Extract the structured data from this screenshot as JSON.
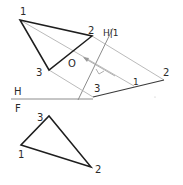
{
  "colors": {
    "background": "#ffffff",
    "object_line": "#1e1e1e",
    "construction_line": "#a8a8a8",
    "folding_line": "#8c8c8c",
    "label": "#2a2a2a"
  },
  "views": {
    "horizontal": {
      "name": "Top view (H)",
      "vertices": {
        "1": {
          "label": "1",
          "x": 20,
          "y": 20
        },
        "2": {
          "label": "2",
          "x": 92,
          "y": 36
        },
        "3": {
          "label": "3",
          "x": 49,
          "y": 70
        }
      }
    },
    "frontal": {
      "name": "Front view (F)",
      "vertices": {
        "1": {
          "label": "1",
          "x": 21,
          "y": 145
        },
        "2": {
          "label": "2",
          "x": 91,
          "y": 167
        },
        "3": {
          "label": "3",
          "x": 49,
          "y": 116
        }
      }
    },
    "auxiliary": {
      "name": "Auxiliary view 1 (edge view)",
      "labels": {
        "1": "1",
        "2": "2",
        "3": "3"
      }
    }
  },
  "folding_lines": {
    "hf": {
      "upper_label": "H",
      "lower_label": "F"
    },
    "h1": {
      "label": "H|1"
    }
  },
  "annotations": {
    "line_of_sight_label": "O",
    "right_angle_mark": true
  }
}
